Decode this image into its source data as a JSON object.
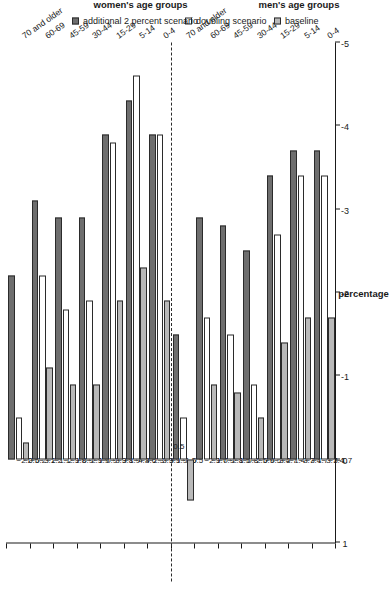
{
  "chart_data": {
    "type": "bar",
    "orientation": "horizontal",
    "title": "",
    "xlabel": "percentage",
    "ylabel": "",
    "ylim": [
      1,
      -5
    ],
    "axis_ticks": [
      "1",
      "0",
      "-1",
      "-2",
      "-3",
      "-4",
      "-5"
    ],
    "grid": false,
    "legend_position": "bottom",
    "panels": [
      {
        "name": "men",
        "label": "men's age groups",
        "categories": [
          "0-4",
          "5-14",
          "15-29",
          "30-44",
          "45-59",
          "60-69",
          "70 and older"
        ],
        "series": [
          {
            "name": "baseline",
            "values": [
              -1.7,
              -1.7,
              -1.4,
              -0.5,
              -0.8,
              -0.9,
              0.5
            ]
          },
          {
            "name": "doubling scenario",
            "values": [
              -3.4,
              -3.4,
              -2.7,
              -0.9,
              -1.5,
              -1.7,
              -0.5
            ]
          },
          {
            "name": "additional 2 percent scenario",
            "values": [
              -3.7,
              -3.7,
              -3.4,
              -2.5,
              -2.8,
              -2.9,
              -1.5
            ]
          }
        ]
      },
      {
        "name": "women",
        "label": "women's age groups",
        "categories": [
          "0-4",
          "5-14",
          "15-29",
          "30-44",
          "45-59",
          "60-69",
          "70 and older"
        ],
        "series": [
          {
            "name": "baseline",
            "values": [
              -1.9,
              -2.3,
              -1.9,
              -0.9,
              -0.9,
              -1.1,
              -0.2
            ]
          },
          {
            "name": "doubling scenario",
            "values": [
              -3.9,
              -4.6,
              -3.8,
              -1.9,
              -1.8,
              -2.2,
              -0.5
            ]
          },
          {
            "name": "additional 2 percent scenario",
            "values": [
              -3.9,
              -4.3,
              -3.9,
              -2.9,
              -2.9,
              -3.1,
              -2.2
            ]
          }
        ]
      }
    ],
    "legend": [
      {
        "label": "baseline",
        "color": "#b9b9b9",
        "key": "baseline"
      },
      {
        "label": "doubling scenario",
        "color": "#ffffff",
        "key": "doubling"
      },
      {
        "label": "additional 2 percent scenario",
        "color": "#6e6e6e",
        "key": "additional"
      }
    ],
    "colors": {
      "baseline": "#b9b9b9",
      "doubling": "#ffffff",
      "additional": "#6e6e6e",
      "axis": "#1a1a1a",
      "separator": "#2b2b2b"
    }
  }
}
